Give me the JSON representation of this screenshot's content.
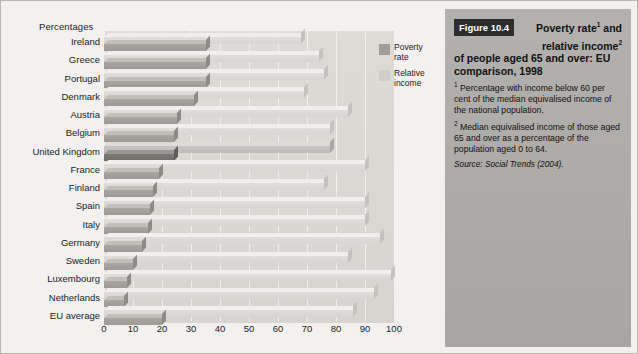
{
  "chart_data": {
    "type": "bar",
    "orientation": "horizontal",
    "xlabel": "Percentages",
    "ylabel": "",
    "xlim": [
      0,
      100
    ],
    "xticks": [
      0,
      10,
      20,
      30,
      40,
      50,
      60,
      70,
      80,
      90,
      100
    ],
    "grid": true,
    "legend_position": "top-right",
    "highlight_category": "United Kingdom",
    "categories": [
      "Ireland",
      "Greece",
      "Portugal",
      "Denmark",
      "Austria",
      "Belgium",
      "United Kingdom",
      "France",
      "Finland",
      "Spain",
      "Italy",
      "Germany",
      "Sweden",
      "Luxembourg",
      "Netherlands",
      "EU average"
    ],
    "series": [
      {
        "name": "Poverty rate",
        "color": "#a09d99",
        "values": [
          35,
          35,
          35,
          31,
          25,
          24,
          24,
          19,
          17,
          16,
          15,
          13,
          10,
          8,
          7,
          20
        ]
      },
      {
        "name": "Relative income",
        "color": "#cfcecb",
        "values": [
          68,
          74,
          76,
          69,
          84,
          78,
          78,
          90,
          76,
          90,
          90,
          95,
          84,
          99,
          93,
          86
        ]
      }
    ]
  },
  "chart": {
    "axis_title": "Percentages",
    "legend": [
      {
        "label_line1": "Poverty",
        "label_line2": "rate",
        "swatch": "poverty-swatch"
      },
      {
        "label_line1": "Relative",
        "label_line2": "income",
        "swatch": "relative-income-swatch"
      }
    ]
  },
  "side_panel": {
    "figure_badge": "Figure 10.4",
    "title_line1": "Poverty rate",
    "title_sup1": "1",
    "title_line1b": " and",
    "title_line2": "relative income",
    "title_sup2": "2",
    "title_rest": "of people aged 65 and over: EU comparison, 1998",
    "note1_marker": "1",
    "note1": "Percentage with income below 60 per cent of the median equivalised income of the national population.",
    "note2_marker": "2",
    "note2": "Median equivalised income of those aged 65 and over as a percentage of the population aged 0 to 64.",
    "source": "Source: Social Trends (2004)."
  }
}
